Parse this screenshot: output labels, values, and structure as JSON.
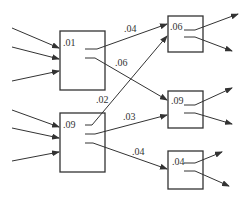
{
  "diagram": {
    "nodes": [
      {
        "id": "A",
        "label": ".01",
        "x": 60,
        "y": 31,
        "w": 45,
        "h": 59
      },
      {
        "id": "B",
        "label": ".09",
        "x": 60,
        "y": 113,
        "w": 45,
        "h": 59
      },
      {
        "id": "C",
        "label": ".06",
        "x": 168,
        "y": 16,
        "w": 35,
        "h": 36
      },
      {
        "id": "D",
        "label": ".09",
        "x": 168,
        "y": 91,
        "w": 35,
        "h": 37
      },
      {
        "id": "E",
        "label": ".04",
        "x": 168,
        "y": 151,
        "w": 35,
        "h": 38
      }
    ],
    "edges": [
      {
        "from": "A",
        "to": "C",
        "label": ".04"
      },
      {
        "from": "A",
        "to": "D",
        "label": ".06"
      },
      {
        "from": "B",
        "to": "C",
        "label": ".02"
      },
      {
        "from": "B",
        "to": "D",
        "label": ".03"
      },
      {
        "from": "B",
        "to": "E",
        "label": ".04"
      }
    ]
  }
}
